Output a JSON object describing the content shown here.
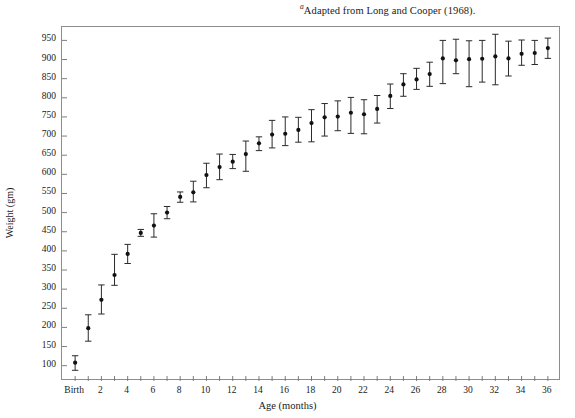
{
  "figure": {
    "source_note_marker": "a",
    "source_note": "Adapted from Long and Cooper (1968).",
    "y_axis_title": "Weight (gm)",
    "x_axis_title": "Age (months)"
  },
  "chart_data": {
    "type": "scatter",
    "title": "",
    "subtitle": "",
    "xlabel": "Age (months)",
    "ylabel": "Weight (gm)",
    "annotation": "aAdapted from Long and Cooper (1968).",
    "grid": false,
    "legend": null,
    "error_bars": "vertical, symmetric-ish, capped",
    "marker": "filled circle",
    "xlim": [
      -1.0,
      37.0
    ],
    "ylim": [
      60,
      985
    ],
    "ytick_values": [
      100,
      150,
      200,
      250,
      300,
      350,
      400,
      450,
      500,
      550,
      600,
      650,
      700,
      750,
      800,
      850,
      900,
      950
    ],
    "ytick_labels": [
      "100",
      "150",
      "200",
      "250",
      "300",
      "350",
      "400",
      "450",
      "500",
      "550",
      "600",
      "650",
      "700",
      "750",
      "800",
      "850",
      "900",
      "950"
    ],
    "xtick_values": [
      0,
      1,
      2,
      3,
      4,
      5,
      6,
      7,
      8,
      9,
      10,
      11,
      12,
      13,
      14,
      15,
      16,
      17,
      18,
      19,
      20,
      21,
      22,
      23,
      24,
      25,
      26,
      27,
      28,
      29,
      30,
      31,
      32,
      33,
      34,
      35,
      36
    ],
    "xtick_labels": [
      "Birth",
      "",
      "2",
      "",
      "4",
      "",
      "6",
      "",
      "8",
      "",
      "10",
      "",
      "12",
      "",
      "14",
      "",
      "16",
      "",
      "18",
      "",
      "20",
      "",
      "22",
      "",
      "24",
      "",
      "26",
      "",
      "28",
      "",
      "30",
      "",
      "32",
      "",
      "34",
      "",
      "36"
    ],
    "x": [
      0,
      1,
      2,
      3,
      4,
      5,
      6,
      7,
      8,
      9,
      10,
      11,
      12,
      13,
      14,
      15,
      16,
      17,
      18,
      19,
      20,
      21,
      22,
      23,
      24,
      25,
      26,
      27,
      28,
      29,
      30,
      31,
      32,
      33,
      34,
      35,
      36
    ],
    "values": [
      108,
      198,
      272,
      337,
      392,
      447,
      466,
      500,
      541,
      553,
      598,
      619,
      633,
      653,
      681,
      704,
      706,
      716,
      734,
      749,
      751,
      761,
      757,
      771,
      805,
      835,
      848,
      862,
      903,
      898,
      901,
      902,
      908,
      903,
      915,
      917,
      930
    ],
    "err_lower": [
      20,
      34,
      37,
      27,
      25,
      9,
      30,
      16,
      14,
      25,
      33,
      33,
      18,
      45,
      19,
      35,
      31,
      32,
      49,
      49,
      37,
      54,
      51,
      37,
      33,
      31,
      26,
      32,
      66,
      35,
      72,
      61,
      74,
      46,
      30,
      30,
      27
    ],
    "err_upper": [
      18,
      35,
      39,
      54,
      25,
      9,
      31,
      16,
      13,
      29,
      31,
      34,
      19,
      34,
      17,
      37,
      44,
      33,
      35,
      36,
      41,
      40,
      38,
      35,
      31,
      28,
      29,
      31,
      47,
      55,
      48,
      48,
      58,
      45,
      36,
      33,
      26
    ],
    "values_label": "Mean body weight (gm)",
    "n_points": 37
  },
  "plot": {
    "frame_color": "#8d8d8d",
    "marker_color": "#111111",
    "errorbar_color": "#2b2b2b"
  }
}
